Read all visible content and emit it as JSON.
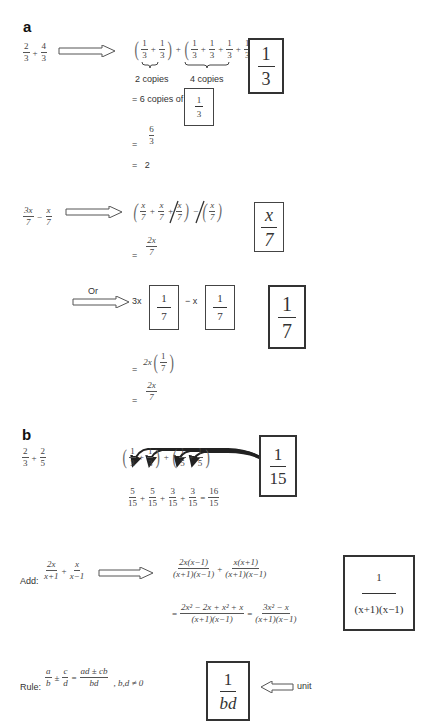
{
  "section_a": {
    "label": "a",
    "example1": {
      "problem": {
        "n1": "2",
        "d1": "3",
        "op": "+",
        "n2": "4",
        "d2": "3"
      },
      "expansion": {
        "group1": [
          {
            "n": "1",
            "d": "3"
          },
          {
            "n": "1",
            "d": "3"
          }
        ],
        "group2": [
          {
            "n": "1",
            "d": "3"
          },
          {
            "n": "1",
            "d": "3"
          },
          {
            "n": "1",
            "d": "3"
          },
          {
            "n": "1",
            "d": "3"
          }
        ],
        "group1_caption": "2 copies",
        "group2_caption": "4 copies"
      },
      "copies_text": "= 6 copies of",
      "copies_unit": {
        "n": "1",
        "d": "3"
      },
      "step1": {
        "eq": "=",
        "n": "6",
        "d": "3"
      },
      "step2": {
        "eq": "=",
        "value": "2"
      },
      "unit_box": {
        "n": "1",
        "d": "3"
      }
    },
    "example2": {
      "problem": {
        "n1": "3x",
        "d1": "7",
        "op": "−",
        "n2": "x",
        "d2": "7"
      },
      "expansion_terms": [
        {
          "n": "x",
          "d": "7"
        },
        {
          "n": "x",
          "d": "7"
        },
        {
          "n": "x",
          "d": "7"
        }
      ],
      "subtract_term": {
        "n": "x",
        "d": "7"
      },
      "result": {
        "eq": "=",
        "n": "2x",
        "d": "7"
      },
      "unit_box": {
        "n": "x",
        "d": "7"
      },
      "or_label": "Or",
      "alt": {
        "coef1": "3x",
        "unit1": {
          "n": "1",
          "d": "7"
        },
        "minus": "− x",
        "unit2": {
          "n": "1",
          "d": "7"
        },
        "unit_box": {
          "n": "1",
          "d": "7"
        },
        "step1": {
          "eq": "=",
          "coef": "2x",
          "n": "1",
          "d": "7"
        },
        "step2": {
          "eq": "=",
          "n": "2x",
          "d": "7"
        }
      }
    }
  },
  "section_b": {
    "label": "b",
    "problem": {
      "n1": "2",
      "d1": "3",
      "op": "+",
      "n2": "2",
      "d2": "5"
    },
    "expansion": [
      {
        "n": "1",
        "d": "3"
      },
      {
        "n": "1",
        "d": "3"
      },
      {
        "n": "1",
        "d": "5"
      },
      {
        "n": "1",
        "d": "5"
      }
    ],
    "sum": [
      {
        "n": "5",
        "d": "15"
      },
      {
        "n": "5",
        "d": "15"
      },
      {
        "n": "3",
        "d": "15"
      },
      {
        "n": "3",
        "d": "15"
      }
    ],
    "sum_result": {
      "eq": "=",
      "n": "16",
      "d": "15"
    },
    "unit_box": {
      "n": "1",
      "d": "15"
    }
  },
  "add_example": {
    "label": "Add:",
    "problem": {
      "n1": "2x",
      "d1": "x+1",
      "op": "+",
      "n2": "x",
      "d2": "x−1"
    },
    "line1": [
      {
        "n": "2x(x−1)",
        "d": "(x+1)(x−1)"
      },
      {
        "n": "x(x+1)",
        "d": "(x+1)(x−1)"
      }
    ],
    "line2": {
      "eq": "=",
      "n1": "2x² − 2x + x² + x",
      "d1": "(x+1)(x−1)",
      "eq2": "=",
      "n2": "3x² − x",
      "d2": "(x+1)(x−1)"
    },
    "unit_box": {
      "n": "1",
      "d": "(x+1)(x−1)"
    }
  },
  "rule": {
    "label": "Rule:",
    "lhs": {
      "n1": "a",
      "d1": "b",
      "op": "±",
      "n2": "c",
      "d2": "d"
    },
    "eq": "=",
    "rhs": {
      "n": "ad ± cb",
      "d": "bd"
    },
    "condition": ", b,d ≠ 0",
    "unit_box": {
      "n": "1",
      "d": "bd"
    },
    "unit_label": "unit"
  }
}
